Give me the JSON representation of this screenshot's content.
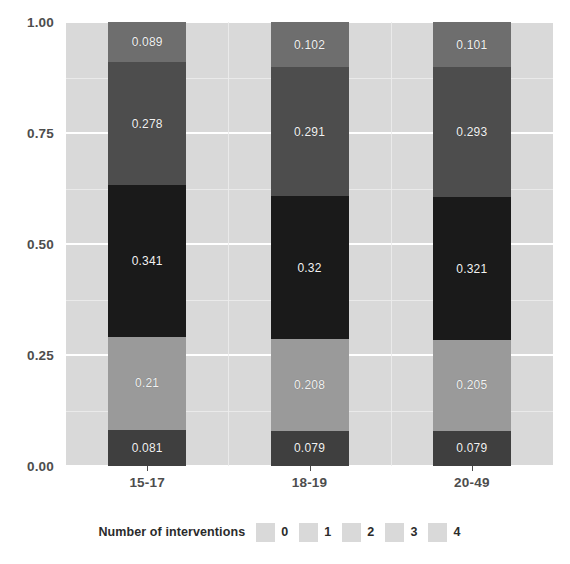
{
  "chart_data": {
    "type": "bar",
    "subtype": "stacked-bar-proportional",
    "title": "",
    "subtitle": "",
    "xlabel": "",
    "ylabel": "",
    "categories": [
      "15-17",
      "18-19",
      "20-49"
    ],
    "ylim": [
      0.0,
      1.0
    ],
    "y_ticks": [
      "0.00",
      "0.25",
      "0.50",
      "0.75",
      "1.00"
    ],
    "y_tick_values": [
      0.0,
      0.25,
      0.5,
      0.75,
      1.0
    ],
    "grid": true,
    "grid_color": "#ffffff",
    "panel_background": "#d9d9d9",
    "legend_position": "bottom",
    "legend_title": "Number of interventions",
    "stack_order": "bottom-to-top",
    "series": [
      {
        "name": "0",
        "color": "#3f3f3f",
        "values": [
          0.081,
          0.079,
          0.079
        ],
        "labels": [
          "0.081",
          "0.079",
          "0.079"
        ]
      },
      {
        "name": "1",
        "color": "#9a9a9a",
        "values": [
          0.21,
          0.208,
          0.205
        ],
        "labels": [
          "0.21",
          "0.208",
          "0.205"
        ]
      },
      {
        "name": "2",
        "color": "#1a1a1a",
        "values": [
          0.341,
          0.32,
          0.321
        ],
        "labels": [
          "0.341",
          "0.32",
          "0.321"
        ]
      },
      {
        "name": "3",
        "color": "#4d4d4d",
        "values": [
          0.278,
          0.291,
          0.293
        ],
        "labels": [
          "0.278",
          "0.291",
          "0.293"
        ]
      },
      {
        "name": "4",
        "color": "#6e6e6e",
        "values": [
          0.089,
          0.102,
          0.101
        ],
        "labels": [
          "0.089",
          "0.102",
          "0.101"
        ]
      }
    ]
  },
  "axis": {
    "y_labels": [
      "1.00",
      "0.75",
      "0.50",
      "0.25",
      "0.00"
    ],
    "x_labels": [
      "15-17",
      "18-19",
      "20-49"
    ]
  },
  "legend": {
    "title": "Number of interventions",
    "items": [
      {
        "label": "0",
        "color": "#3f3f3f"
      },
      {
        "label": "1",
        "color": "#9a9a9a"
      },
      {
        "label": "2",
        "color": "#1a1a1a"
      },
      {
        "label": "3",
        "color": "#4d4d4d"
      },
      {
        "label": "4",
        "color": "#6e6e6e"
      }
    ]
  }
}
